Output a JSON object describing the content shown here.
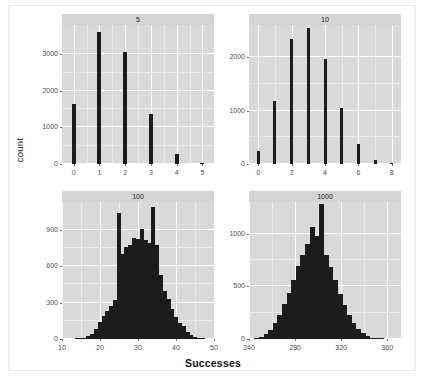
{
  "figure": {
    "xlabel": "Successes",
    "ylabel": "count",
    "panel_bg": "#d9d9d9",
    "strip_bg": "#d4d4d4",
    "bar_color": "#1c1c1c",
    "grid_color": "#ffffff"
  },
  "chart_data": [
    {
      "type": "bar",
      "title": "5",
      "facet": "5",
      "xlabel": "Successes",
      "ylabel": "count",
      "xlim": [
        -0.45,
        5.45
      ],
      "ylim": [
        0,
        3800
      ],
      "xticks": [
        0,
        1,
        2,
        3,
        4,
        5
      ],
      "yticks": [
        0,
        1000,
        2000,
        3000
      ],
      "grid": true,
      "categories": [
        0,
        1,
        2,
        3,
        4,
        5
      ],
      "values": [
        1650,
        3620,
        3050,
        1370,
        280,
        15
      ]
    },
    {
      "type": "bar",
      "title": "10",
      "facet": "10",
      "xlabel": "Successes",
      "ylabel": "count",
      "xlim": [
        -0.55,
        8.55
      ],
      "ylim": [
        0,
        2600
      ],
      "xticks": [
        0,
        2,
        4,
        6,
        8
      ],
      "yticks": [
        0,
        1000,
        2000
      ],
      "grid": true,
      "categories": [
        0,
        1,
        2,
        3,
        4,
        5,
        6,
        7,
        8
      ],
      "values": [
        250,
        1180,
        2340,
        2540,
        1960,
        1040,
        380,
        80,
        10
      ]
    },
    {
      "type": "bar",
      "title": "100",
      "facet": "100",
      "xlabel": "Successes",
      "ylabel": "count",
      "xlim": [
        10,
        50
      ],
      "ylim": [
        0,
        1130
      ],
      "xticks": [
        10,
        20,
        30,
        40,
        50
      ],
      "yticks": [
        0,
        300,
        600,
        900
      ],
      "grid": true,
      "categories": [
        14,
        15,
        16,
        17,
        18,
        19,
        20,
        21,
        22,
        23,
        24,
        25,
        26,
        27,
        28,
        29,
        30,
        31,
        32,
        33,
        34,
        35,
        36,
        37,
        38,
        39,
        40,
        41,
        42,
        43,
        44,
        45,
        46,
        47
      ],
      "values": [
        2,
        5,
        10,
        25,
        45,
        85,
        140,
        190,
        235,
        270,
        320,
        1040,
        700,
        760,
        775,
        830,
        825,
        910,
        820,
        795,
        1090,
        775,
        530,
        400,
        330,
        250,
        185,
        130,
        105,
        60,
        35,
        20,
        10,
        4
      ]
    },
    {
      "type": "bar",
      "title": "1000",
      "facet": "1000",
      "xlabel": "Successes",
      "ylabel": "count",
      "xlim": [
        240,
        372
      ],
      "ylim": [
        0,
        1300
      ],
      "xticks": [
        240,
        280,
        320,
        360
      ],
      "yticks": [
        0,
        500,
        1000
      ],
      "grid": true,
      "categories": [
        247,
        251,
        255,
        259,
        263,
        267,
        271,
        275,
        279,
        283,
        287,
        291,
        295,
        299,
        303,
        307,
        311,
        315,
        319,
        323,
        327,
        331,
        335,
        339,
        343,
        347,
        351,
        355
      ],
      "values": [
        8,
        20,
        45,
        90,
        150,
        230,
        330,
        440,
        560,
        690,
        800,
        900,
        1060,
        980,
        1280,
        800,
        680,
        560,
        430,
        320,
        230,
        150,
        95,
        55,
        28,
        14,
        6,
        2
      ]
    }
  ]
}
